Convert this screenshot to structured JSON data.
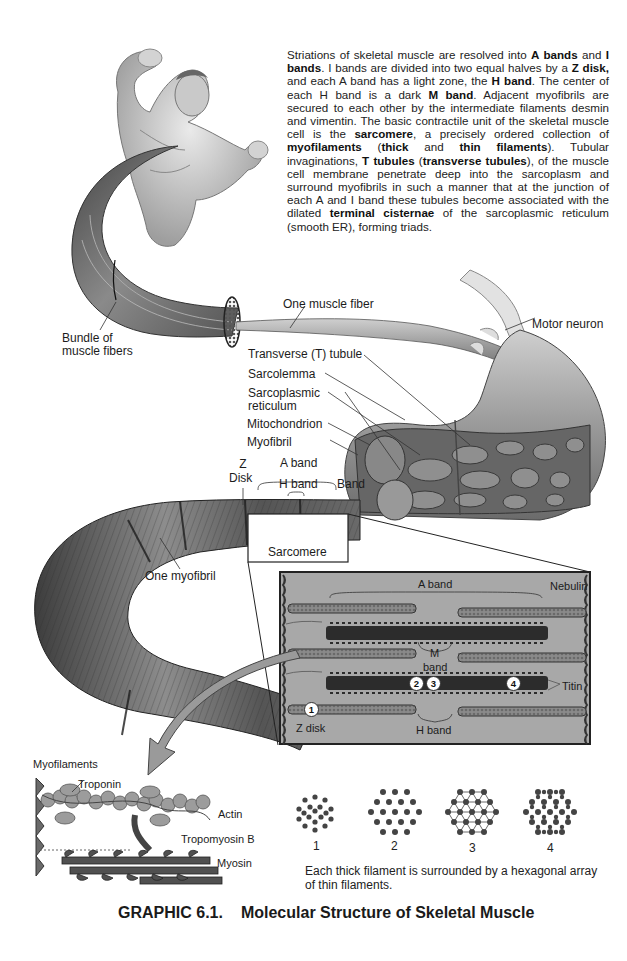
{
  "paragraph": {
    "segments": [
      {
        "t": "Striations of skeletal muscle are resolved into ",
        "b": false
      },
      {
        "t": "A bands",
        "b": true
      },
      {
        "t": " and ",
        "b": false
      },
      {
        "t": "I bands",
        "b": true
      },
      {
        "t": ". I bands are divided into two equal halves by a ",
        "b": false
      },
      {
        "t": "Z disk,",
        "b": true
      },
      {
        "t": " and each A band has a light zone, the ",
        "b": false
      },
      {
        "t": "H band",
        "b": true
      },
      {
        "t": ". The center of each H band is a dark ",
        "b": false
      },
      {
        "t": "M band",
        "b": true
      },
      {
        "t": ". Adjacent myofibrils are secured to each other by the intermediate filaments desmin and vimentin. The basic contractile unit of the skeletal muscle cell is the ",
        "b": false
      },
      {
        "t": "sarcomere",
        "b": true
      },
      {
        "t": ", a precisely ordered collection of ",
        "b": false
      },
      {
        "t": "myofilaments",
        "b": true
      },
      {
        "t": " (",
        "b": false
      },
      {
        "t": "thick",
        "b": true
      },
      {
        "t": " and ",
        "b": false
      },
      {
        "t": "thin filaments",
        "b": true
      },
      {
        "t": "). Tubular invaginations, ",
        "b": false
      },
      {
        "t": "T tubules",
        "b": true
      },
      {
        "t": " (",
        "b": false
      },
      {
        "t": "transverse tubules",
        "b": true
      },
      {
        "t": "), of the muscle cell membrane penetrate deep into the sarcoplasm and surround myofibrils in such a manner that at the junction of each A and I band these tubules become associated with the dilated ",
        "b": false
      },
      {
        "t": "terminal cisternae",
        "b": true
      },
      {
        "t": " of the sarcoplasmic reticulum (smooth ER), forming triads.",
        "b": false
      }
    ]
  },
  "labels": {
    "bundle_line1": "Bundle of",
    "bundle_line2": "muscle fibers",
    "one_muscle_fiber": "One muscle fiber",
    "motor_neuron": "Motor neuron",
    "t_tubule": "Transverse (T) tubule",
    "sarcolemma": "Sarcolemma",
    "sarcoplasmic_line1": "Sarcoplasmic",
    "sarcoplasmic_line2": "reticulum",
    "mitochondrion": "Mitochondrion",
    "myofibril": "Myofibril",
    "z_line1": "Z",
    "z_line2": "Disk",
    "a_band": "A band",
    "h_band": "H band",
    "i_band": "Band",
    "sarcomere": "Sarcomere",
    "one_myofibril": "One myofibril"
  },
  "sarcomere_inset": {
    "a_band": "A band",
    "nebulin": "Nebulin",
    "m_band_line1": "M",
    "m_band_line2": "band",
    "titin": "Titin",
    "z_disk": "Z disk",
    "h_band": "H band",
    "markers": [
      "1",
      "2",
      "3",
      "4"
    ]
  },
  "myofilaments": {
    "title": "Myofilaments",
    "troponin": "Troponin",
    "actin": "Actin",
    "tropomyosin": "Tropomyosin B",
    "myosin": "Myosin"
  },
  "cross_sections": {
    "numbers": [
      "1",
      "2",
      "3",
      "4"
    ],
    "note": "Each thick filament is surrounded by a hexagonal array of thin filaments."
  },
  "caption": {
    "number": "GRAPHIC 6.1.",
    "title": "Molecular Structure of Skeletal Muscle"
  },
  "colors": {
    "text": "#1a1a1a",
    "muscle_dark": "#3a3a3a",
    "muscle_mid": "#777777",
    "muscle_light": "#b5b5b5",
    "inset_bg": "#a9a9a9",
    "arrow": "#9a9a9a"
  }
}
